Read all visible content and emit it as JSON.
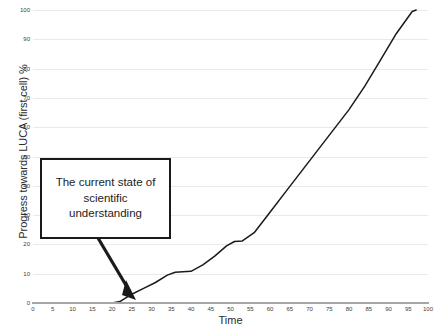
{
  "chart_data": {
    "type": "line",
    "title": "",
    "xlabel": "Time",
    "ylabel": "Progress towards LUCA (first cell) %",
    "xlim": [
      0,
      100
    ],
    "ylim": [
      0,
      100
    ],
    "grid": true,
    "legend": "none",
    "xticks": [
      0,
      5,
      10,
      15,
      20,
      25,
      30,
      35,
      40,
      45,
      50,
      55,
      60,
      65,
      70,
      75,
      80,
      85,
      90,
      95,
      100
    ],
    "yticks": [
      0,
      10,
      20,
      30,
      40,
      50,
      60,
      70,
      80,
      90,
      100
    ],
    "series": [
      {
        "name": "Progress towards LUCA",
        "color": "#1a1a1a",
        "x": [
          0,
          5,
          10,
          15,
          20,
          22,
          25,
          28,
          31,
          34,
          36,
          38,
          40,
          43,
          46,
          49,
          51,
          53,
          56,
          60,
          64,
          68,
          72,
          76,
          80,
          84,
          88,
          92,
          96,
          97
        ],
        "y": [
          0,
          0,
          0,
          0,
          0,
          0.5,
          3,
          5,
          7,
          9.5,
          10.5,
          10.7,
          10.8,
          13,
          16,
          19.5,
          21,
          21.2,
          24,
          31,
          38,
          45,
          52,
          59,
          66,
          74,
          83,
          92,
          99.5,
          100
        ]
      }
    ],
    "annotations": [
      {
        "name": "current-state-callout",
        "lines": [
          "The current state of",
          "scientific",
          "understanding"
        ],
        "points_to": {
          "x": 22,
          "y": 0.5
        }
      }
    ]
  },
  "chart": {
    "y_axis_title": "Progress towards LUCA (first cell) %",
    "x_axis_title": "Time",
    "annotation": {
      "line1": "The current state of",
      "line2": "scientific",
      "line3": "understanding"
    },
    "colors": {
      "curve": "#1a1a1a",
      "gridline": "#e9e9e9",
      "axis": "#a6a6a6",
      "text": "#2b2b2b",
      "tick_text": "#3d3d3d",
      "annotation_border": "#1a1a1a",
      "background": "#ffffff"
    }
  }
}
